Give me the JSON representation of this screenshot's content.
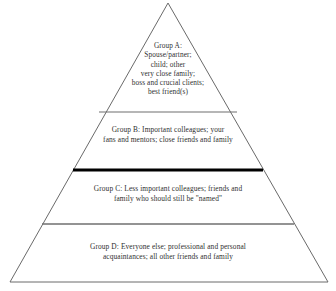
{
  "figure": {
    "name": "relationship-pyramid",
    "type": "pyramid-diagram",
    "tier_count": 4,
    "background_color": "#ffffff",
    "edge_color": "#6a6a6a",
    "text_color": "#2f2f2f",
    "thick_divider_color": "#000000",
    "thin_divider_color": "#6f6f6f"
  },
  "geometry": {
    "apex": {
      "x": 168,
      "y": 3
    },
    "base_left": {
      "x": 10,
      "y": 282
    },
    "base_right": {
      "x": 328,
      "y": 282
    },
    "dividers": [
      {
        "id": "a-b",
        "y": 112,
        "left_x": 99,
        "right_x": 237,
        "weight": "thin",
        "color": "#6f6f6f"
      },
      {
        "id": "b-c",
        "y": 170,
        "left_x": 73,
        "right_x": 263,
        "weight": "thick",
        "color": "#000000"
      },
      {
        "id": "c-d",
        "y": 224,
        "left_x": 42,
        "right_x": 294,
        "weight": "thin",
        "color": "#6f6f6f"
      }
    ]
  },
  "tiers": [
    {
      "id": "group-a",
      "label": "Group A",
      "heading": "Group A:",
      "lines": [
        "Group A:",
        "Spouse/partner;",
        "child; other",
        "very close family;",
        "boss and crucial clients;",
        "best friend(s)"
      ]
    },
    {
      "id": "group-b",
      "label": "Group B",
      "heading": "Group B:",
      "lines": [
        "Group B: Important colleagues; your",
        "fans and mentors; close friends and family"
      ]
    },
    {
      "id": "group-c",
      "label": "Group C",
      "heading": "Group C:",
      "lines": [
        "Group C: Less important colleagues; friends and",
        "family who should still be \"named\""
      ]
    },
    {
      "id": "group-d",
      "label": "Group D",
      "heading": "Group D:",
      "lines": [
        "Group D: Everyone else; professional and personal",
        "acquaintances; all other friends and family"
      ]
    }
  ]
}
